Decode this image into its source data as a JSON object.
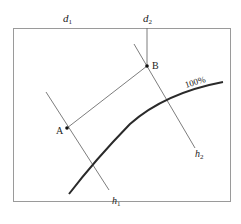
{
  "diagram": {
    "labels": {
      "d1": "d",
      "d1_sub": "1",
      "d2": "d",
      "d2_sub": "2",
      "point_a": "A",
      "point_b": "B",
      "h1": "h",
      "h1_sub": "1",
      "h2": "h",
      "h2_sub": "2",
      "curve": "100%"
    },
    "colors": {
      "frame": "#9a9a9a",
      "line": "#6e6e6e",
      "curve": "#2a2a2a",
      "point": "#111111",
      "text": "#222222"
    }
  }
}
